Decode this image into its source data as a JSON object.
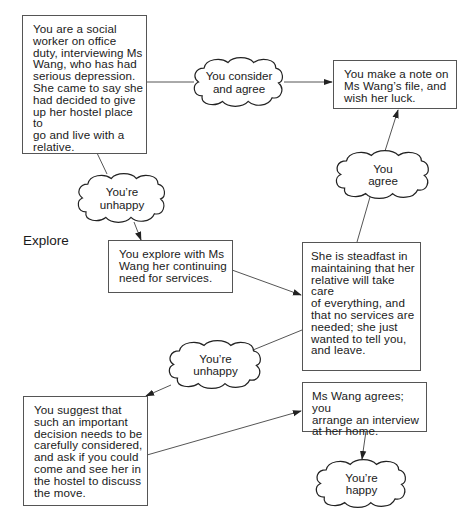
{
  "diagram": {
    "type": "decision-flow",
    "side_label": "Explore",
    "boxes": [
      {
        "id": "start",
        "text": "You are a social\nworker on office\nduty, interviewing Ms\nWang, who has had\nserious depression.\nShe came to say she\nhad decided to give\nup her hostel place to\ngo and live with a\nrelative."
      },
      {
        "id": "note",
        "text": "You make a note on\nMs Wang’s file, and\nwish her luck."
      },
      {
        "id": "explore",
        "text": "You explore with Ms\nWang her continuing\nneed for services."
      },
      {
        "id": "steadfast",
        "text": "She is steadfast in\nmaintaining that her\nrelative will take care\nof everything, and\nthat no services are\nneeded; she just\nwanted to tell you,\nand leave."
      },
      {
        "id": "suggest",
        "text": "You suggest that\nsuch an important\ndecision needs to be\ncarefully considered,\nand ask if you could\ncome and see her in\nthe hostel to discuss\nthe move."
      },
      {
        "id": "agrees",
        "text": "Ms Wang agrees; you\narrange an interview\nat her home."
      }
    ],
    "clouds": [
      {
        "id": "consider",
        "text": "You consider\nand agree"
      },
      {
        "id": "agree",
        "text": "You\nagree"
      },
      {
        "id": "unhappy1",
        "text": "You’re\nunhappy"
      },
      {
        "id": "unhappy2",
        "text": "You’re\nunhappy"
      },
      {
        "id": "happy",
        "text": "You’re\nhappy"
      }
    ],
    "edges": [
      {
        "from": "start",
        "to": "note",
        "via": "consider"
      },
      {
        "from": "steadfast",
        "to": "note",
        "via": "agree"
      },
      {
        "from": "start",
        "to": "explore",
        "via": "unhappy1"
      },
      {
        "from": "explore",
        "to": "steadfast"
      },
      {
        "from": "steadfast",
        "to": "suggest",
        "via": "unhappy2"
      },
      {
        "from": "suggest",
        "to": "agrees"
      },
      {
        "from": "agrees",
        "to": "happy"
      }
    ]
  }
}
